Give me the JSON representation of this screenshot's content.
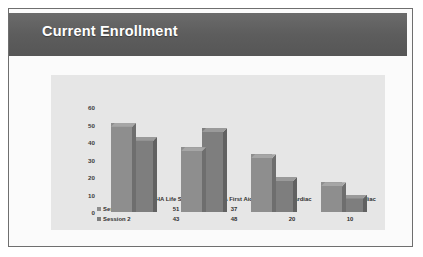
{
  "slide": {
    "title": "Current Enrollment",
    "banner_color": "#5d5d5d",
    "title_color": "#ffffff",
    "plot_background": "#e6e6e6"
  },
  "chart_data": {
    "type": "bar",
    "title": "Current Enrollment",
    "xlabel": "",
    "ylabel": "",
    "ylim": [
      0,
      60
    ],
    "yticks": [
      "0",
      "10",
      "20",
      "30",
      "40",
      "50",
      "60"
    ],
    "grid": false,
    "legend_position": "bottom-left-table",
    "categories": [
      "AHA Life Support",
      "AHA First Aid",
      "Basic Cardiac",
      "Advanced Cardiac"
    ],
    "series": [
      {
        "name": "Session 1",
        "color": "#8e8e8e",
        "values": [
          51,
          37,
          33,
          17
        ]
      },
      {
        "name": "Session 2",
        "color": "#7e7e7e",
        "values": [
          43,
          48,
          20,
          10
        ]
      }
    ],
    "data_table": {
      "header": [
        "",
        "AHA Life Support",
        "AHA First Aid",
        "Basic Cardiac",
        "Advanced Cardiac"
      ],
      "rows": [
        {
          "label": "Session 1",
          "values": [
            "51",
            "37",
            "33",
            "17"
          ]
        },
        {
          "label": "Session 2",
          "values": [
            "43",
            "48",
            "20",
            "10"
          ]
        }
      ]
    }
  }
}
